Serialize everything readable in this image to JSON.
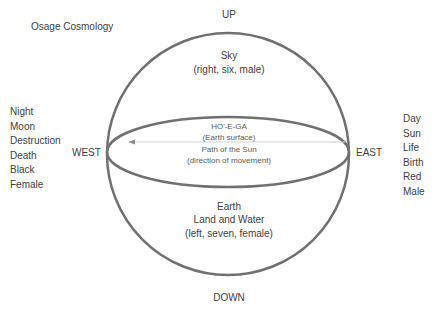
{
  "title": "Osage Cosmology",
  "directions": {
    "up": "UP",
    "down": "DOWN",
    "west": "WEST",
    "east": "EAST"
  },
  "sky": {
    "name": "Sky",
    "attributes": "(right, six, male)"
  },
  "horizon": {
    "name": "HO'-E-GA",
    "subtitle": "(Earth surface)",
    "path": "Path of the Sun",
    "note": "(direction of movement)"
  },
  "earth": {
    "name": "Earth",
    "subtitle": "Land and Water",
    "attributes": "(left, seven, female)"
  },
  "west_associations": [
    "Night",
    "Moon",
    "Destruction",
    "Death",
    "Black",
    "Female"
  ],
  "east_associations": [
    "Day",
    "Sun",
    "Life",
    "Birth",
    "Red",
    "Male"
  ],
  "colors": {
    "outline": "#707070",
    "arrow": "#bfbfbf",
    "text": "#404040"
  }
}
